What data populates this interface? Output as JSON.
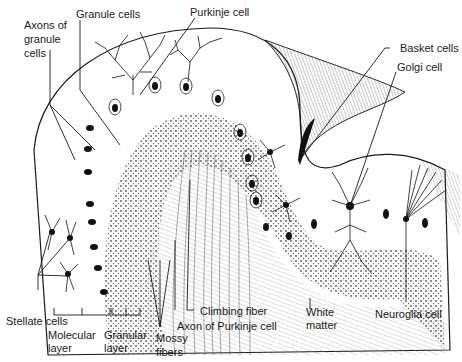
{
  "figure": {
    "labels": {
      "axons_of_granule_cells": [
        "Axons of",
        "granule",
        "cells"
      ],
      "granule_cells": "Granule cells",
      "purkinje_cell": "Purkinje cell",
      "basket_cells": "Basket cells",
      "golgi_cell": "Golgi cell",
      "stellate_cells": "Stellate cells",
      "molecular_layer": [
        "Molecular",
        "layer"
      ],
      "granular_layer": [
        "Granular",
        "layer"
      ],
      "mossy_fibers": [
        "Mossy",
        "fibers"
      ],
      "climbing_fiber": "Climbing fiber",
      "axon_of_purkinje_cell": "Axon of Purkinje cell",
      "white_matter": [
        "White",
        "matter"
      ],
      "neuroglia_cell": "Neuroglia cell"
    }
  }
}
